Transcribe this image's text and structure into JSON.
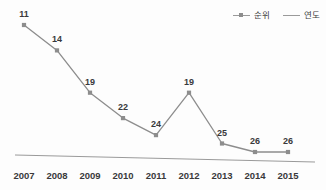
{
  "chart_data": {
    "type": "line",
    "title": "",
    "xlabel": "",
    "ylabel": "",
    "grid": false,
    "legend_position": "top-right",
    "categories": [
      "2007",
      "2008",
      "2009",
      "2010",
      "2011",
      "2012",
      "2013",
      "2014",
      "2015"
    ],
    "series": [
      {
        "name": "순위",
        "values": [
          11,
          14,
          19,
          22,
          24,
          19,
          25,
          26,
          26
        ],
        "color": "#8d8d8d",
        "marker": "square",
        "data_labels": [
          "11",
          "14",
          "19",
          "22",
          "24",
          "19",
          "25",
          "26",
          "26"
        ]
      },
      {
        "name": "연도",
        "values": [
          2007,
          2008,
          2009,
          2010,
          2011,
          2012,
          2013,
          2014,
          2015
        ],
        "color": "#9a9a9a",
        "marker": "none",
        "data_labels": []
      }
    ],
    "ylim": [
      27,
      10
    ],
    "y_inverted": true,
    "axis_tick_labels": [
      "2007",
      "2008",
      "2009",
      "2010",
      "2011",
      "2012",
      "2013",
      "2014",
      "2015"
    ]
  },
  "legend": {
    "entries": [
      {
        "label": "순위"
      },
      {
        "label": "연도"
      }
    ]
  },
  "colors": {
    "rank_line": "#8d8d8d",
    "year_line": "#9a9a9a",
    "label_text": "#39393b",
    "background": "#fdfdfd"
  }
}
